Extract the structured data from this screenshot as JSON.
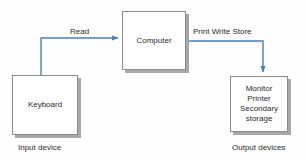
{
  "diagram": {
    "background_color": "#fefefe",
    "arrow_color": "#4a7ebb",
    "box_border_color": "#8a8a8a",
    "box_shadow_color": "#a8a8a8",
    "text_color": "#2b2b2b"
  },
  "nodes": {
    "keyboard": {
      "label": "Keyboard",
      "caption": "Input device"
    },
    "computer": {
      "label": "Computer"
    },
    "output": {
      "lines": [
        "Monitor",
        "Printer",
        "Secondary",
        "storage"
      ],
      "caption": "Output devices"
    }
  },
  "edges": {
    "read": {
      "label": "Read",
      "from": "keyboard",
      "to": "computer"
    },
    "print_write_store": {
      "label": "Print Write Store",
      "from": "computer",
      "to": "output"
    }
  }
}
